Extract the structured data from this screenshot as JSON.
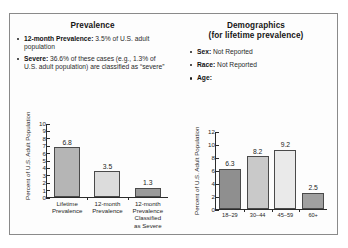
{
  "figure": {
    "panels": {
      "prevalence": {
        "title": "Prevalence",
        "bullets": [
          {
            "label": "12-month Prevalence:",
            "text": " 3.5% of U.S. adult population"
          },
          {
            "label": "Severe:",
            "text": " 36.6% of these cases (e.g., 1.3% of U.S. adult population) are classified as “severe”"
          }
        ]
      },
      "demographics": {
        "title_line1": "Demographics",
        "title_line2": "(for lifetime prevalence)",
        "bullets": [
          {
            "label": "Sex:",
            "text": " Not Reported"
          },
          {
            "label": "Race:",
            "text": " Not Reported"
          },
          {
            "label": "Age:",
            "text": ""
          }
        ]
      }
    }
  },
  "chart_data": [
    {
      "type": "bar",
      "id": "prevalence-chart",
      "title": "",
      "xlabel": "",
      "ylabel": "Percent of U.S. Adult Population",
      "ylim": [
        0,
        10
      ],
      "yticks": [
        0,
        1,
        2,
        3,
        4,
        5,
        6,
        7,
        8,
        9,
        10
      ],
      "grid": false,
      "legend": "none",
      "categories": [
        "Lifetime Prevalence",
        "12-month Prevalence",
        "12-month Prevalence Classified as Severe"
      ],
      "category_lines": [
        [
          "Lifetime",
          "Prevalence"
        ],
        [
          "12-month",
          "Prevalence"
        ],
        [
          "12-month",
          "Prevalence",
          "Classified",
          "as Severe"
        ]
      ],
      "values": [
        6.8,
        3.5,
        1.3
      ],
      "value_labels": [
        "6.8",
        "3.5",
        "1.3"
      ],
      "bar_colors": [
        "#b5b5b5",
        "#dcdcdc",
        "#9a9a9a"
      ]
    },
    {
      "type": "bar",
      "id": "demographics-age-chart",
      "title": "",
      "xlabel": "",
      "ylabel": "Percent of U.S. Adult Population",
      "ylim": [
        0,
        12
      ],
      "yticks": [
        0,
        2,
        4,
        6,
        8,
        10,
        12
      ],
      "grid": false,
      "legend": "none",
      "categories": [
        "18–29",
        "30–44",
        "45–59",
        "60+"
      ],
      "values": [
        6.3,
        8.2,
        9.2,
        2.5
      ],
      "value_labels": [
        "6.3",
        "8.2",
        "9.2",
        "2.5"
      ],
      "bar_colors": [
        "#8f8f8f",
        "#c9c9c9",
        "#eaeaea",
        "#a0a0a0"
      ]
    }
  ]
}
